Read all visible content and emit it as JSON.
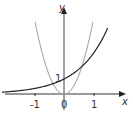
{
  "chart_data": {
    "type": "line",
    "title": "",
    "xlabel": "x",
    "ylabel": "y",
    "x_ticks": [
      "-1",
      "0",
      "1"
    ],
    "y_ticks": [
      "1"
    ],
    "xlim": [
      -2.2,
      1.9
    ],
    "ylim": [
      -0.6,
      6.2
    ],
    "grid": false,
    "legend": null,
    "series": [
      {
        "name": "exponential",
        "color": "#222222",
        "formula": "y = e^x",
        "x": [
          -2.2,
          -1.5,
          -1,
          -0.5,
          0,
          0.5,
          1,
          1.5
        ],
        "values": [
          0.11,
          0.22,
          0.37,
          0.61,
          1.0,
          1.65,
          2.72,
          4.48
        ]
      },
      {
        "name": "parabola",
        "color": "#aaaaaa",
        "formula": "y = 5x^2",
        "x": [
          -1,
          -0.75,
          -0.5,
          -0.25,
          0,
          0.25,
          0.5,
          0.75,
          1
        ],
        "values": [
          5,
          2.81,
          1.25,
          0.31,
          0,
          0.31,
          1.25,
          2.81,
          5
        ]
      }
    ]
  },
  "labels": {
    "x_axis": "x",
    "y_axis": "y",
    "tick_neg1": "-1",
    "tick_0": "0",
    "tick_1": "1",
    "y_tick_1": "1"
  }
}
